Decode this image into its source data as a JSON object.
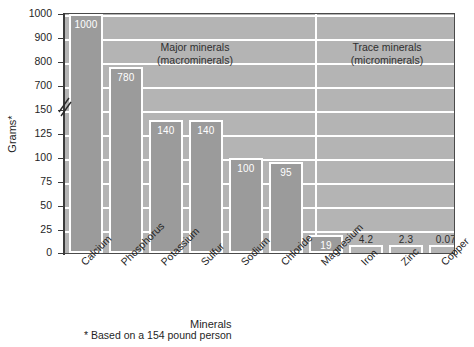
{
  "chart_data": {
    "type": "bar",
    "title": "",
    "xlabel": "Minerals",
    "ylabel": "Grams*",
    "footnote": "* Based on a 154 pound person",
    "categories": [
      "Calcium",
      "Phosphorus",
      "Potassium",
      "Sulfur",
      "Sodium",
      "Chloride",
      "Magnesium",
      "Iron",
      "Zinc",
      "Copper",
      "Iodide"
    ],
    "values": [
      1000,
      780,
      140,
      140,
      100,
      95,
      19,
      4.2,
      2.3,
      0.07,
      0.02
    ],
    "value_labels": [
      "1000",
      "780",
      "140",
      "140",
      "100",
      "95",
      "19",
      "4.2",
      "2.3",
      "0.07",
      "0.02"
    ],
    "ytick_labels": [
      "1000",
      "900",
      "800",
      "700",
      "150",
      "125",
      "100",
      "75",
      "50",
      "25",
      "0"
    ],
    "ytick_values": [
      1000,
      900,
      800,
      700,
      150,
      125,
      100,
      75,
      50,
      25,
      0
    ],
    "axis_break": true,
    "axis_break_between": [
      150,
      700
    ],
    "grid": true,
    "legend": "none",
    "groups": [
      {
        "name": "Major minerals\n(macrominerals)",
        "line1": "Major minerals",
        "line2": "(macrominerals)",
        "members": [
          "Calcium",
          "Phosphorus",
          "Potassium",
          "Sulfur",
          "Sodium",
          "Chloride",
          "Magnesium"
        ]
      },
      {
        "name": "Trace minerals\n(microminerals)",
        "line1": "Trace minerals",
        "line2": "(microminerals)",
        "members": [
          "Iron",
          "Zinc",
          "Copper",
          "Iodide"
        ]
      }
    ],
    "colors": {
      "plot_background": "#b4b4b4",
      "bar_fill": "#9b9b9b",
      "bar_border": "#ffffff",
      "gridline": "#ffffff",
      "axis": "#3b3b3b",
      "text": "#1f1f1f",
      "bar_label_text": "#ffffff"
    }
  },
  "axis": {
    "ylabel": "Grams*",
    "xlabel": "Minerals"
  },
  "notes": {
    "footnote": "* Based on a 154 pound person"
  },
  "sections": {
    "major_line1": "Major minerals",
    "major_line2": "(macrominerals)",
    "trace_line1": "Trace minerals",
    "trace_line2": "(microminerals)"
  },
  "yticks": [
    {
      "label": "1000"
    },
    {
      "label": "900"
    },
    {
      "label": "800"
    },
    {
      "label": "700"
    },
    {
      "label": "150"
    },
    {
      "label": "125"
    },
    {
      "label": "100"
    },
    {
      "label": "75"
    },
    {
      "label": "50"
    },
    {
      "label": "25"
    },
    {
      "label": "0"
    }
  ],
  "bars": [
    {
      "category": "Calcium",
      "value": 1000,
      "label": "1000"
    },
    {
      "category": "Phosphorus",
      "value": 780,
      "label": "780"
    },
    {
      "category": "Potassium",
      "value": 140,
      "label": "140"
    },
    {
      "category": "Sulfur",
      "value": 140,
      "label": "140"
    },
    {
      "category": "Sodium",
      "value": 100,
      "label": "100"
    },
    {
      "category": "Chloride",
      "value": 95,
      "label": "95"
    },
    {
      "category": "Magnesium",
      "value": 19,
      "label": "19"
    },
    {
      "category": "Iron",
      "value": 4.2,
      "label": "4.2"
    },
    {
      "category": "Zinc",
      "value": 2.3,
      "label": "2.3"
    },
    {
      "category": "Copper",
      "value": 0.07,
      "label": "0.07"
    },
    {
      "category": "Iodide",
      "value": 0.02,
      "label": "0.02"
    }
  ]
}
